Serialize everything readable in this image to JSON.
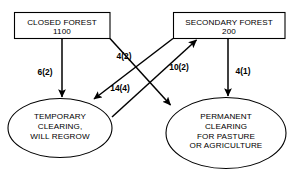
{
  "diagram": {
    "type": "flow-diagram",
    "colors": {
      "background": "#ffffff",
      "stroke": "#000000",
      "fill": "#ffffff",
      "text": "#000000"
    },
    "nodes": [
      {
        "id": "closed-forest",
        "shape": "rectangle",
        "lines": [
          "CLOSED FOREST",
          "1100"
        ],
        "label": "CLOSED FOREST",
        "value": "1100"
      },
      {
        "id": "secondary-forest",
        "shape": "rectangle",
        "lines": [
          "SECONDARY FOREST",
          "200"
        ],
        "label": "SECONDARY FOREST",
        "value": "200"
      },
      {
        "id": "temporary-clearing",
        "shape": "ellipse",
        "lines": [
          "TEMPORARY",
          "CLEARING,",
          "WILL REGROW"
        ],
        "label": "TEMPORARY CLEARING, WILL REGROW"
      },
      {
        "id": "permanent-clearing",
        "shape": "ellipse",
        "lines": [
          "PERMANENT",
          "CLEARING",
          "FOR PASTURE",
          "OR AGRICULTURE"
        ],
        "label": "PERMANENT CLEARING FOR PASTURE OR AGRICULTURE"
      }
    ],
    "edges": [
      {
        "id": "edge-closed-to-temporary",
        "from": "closed-forest",
        "to": "temporary-clearing",
        "label": "6(2)",
        "flux": 6,
        "uncertainty": 2
      },
      {
        "id": "edge-closed-to-permanent",
        "from": "closed-forest",
        "to": "permanent-clearing",
        "label": "4(2)",
        "flux": 4,
        "uncertainty": 2
      },
      {
        "id": "edge-temporary-to-secondary",
        "from": "temporary-clearing",
        "to": "secondary-forest",
        "label": "10(2)",
        "flux": 10,
        "uncertainty": 2
      },
      {
        "id": "edge-secondary-to-temporary",
        "from": "secondary-forest",
        "to": "temporary-clearing",
        "label": "14(4)",
        "flux": 14,
        "uncertainty": 4
      },
      {
        "id": "edge-secondary-to-permanent",
        "from": "secondary-forest",
        "to": "permanent-clearing",
        "label": "4(1)",
        "flux": 4,
        "uncertainty": 1
      }
    ]
  }
}
